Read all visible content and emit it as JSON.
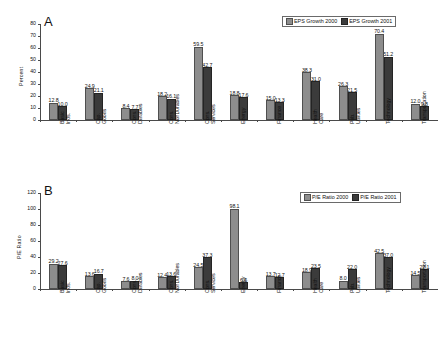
{
  "figure": {
    "panel_a_letter": "A",
    "panel_b_letter": "B"
  },
  "chart_data": [
    {
      "type": "bar",
      "panel": "A",
      "title": "A",
      "xlabel": "",
      "ylabel": "Percent",
      "ylim": [
        0,
        80
      ],
      "yticks": [
        0,
        10,
        20,
        30,
        40,
        50,
        60,
        70,
        80
      ],
      "grid": false,
      "legend_position": "top-right",
      "categories": [
        "Basic Inds.",
        "Cap. Goods",
        "Cons. Durables",
        "Cons. NonDurables",
        "Cons. Services",
        "Energy",
        "Finance",
        "Health Care",
        "Pub. Utilities",
        "Technology",
        "Transportation"
      ],
      "series": [
        {
          "name": "EPS Growth 2000",
          "color": "#8d8d8d",
          "values": [
            12.8,
            24.9,
            8.4,
            18.2,
            59.5,
            18.8,
            15.0,
            38.3,
            26.3,
            70.4,
            12.0
          ]
        },
        {
          "name": "EPS Growth 2001",
          "color": "#3b3b3b",
          "values": [
            10.0,
            21.1,
            7.7,
            16.1,
            42.7,
            17.6,
            13.3,
            31.0,
            21.5,
            51.2,
            9.8
          ]
        }
      ]
    },
    {
      "type": "bar",
      "panel": "B",
      "title": "B",
      "xlabel": "",
      "ylabel": "P/E Ratio",
      "ylim": [
        0,
        120
      ],
      "yticks": [
        0,
        20,
        40,
        60,
        80,
        100,
        120
      ],
      "grid": false,
      "legend_position": "top-right",
      "categories": [
        "Basic Inds.",
        "Cap. Goods",
        "Cons. Durables",
        "Cons. NonDurables",
        "Cons. Services",
        "Energy",
        "Finance",
        "Health Care",
        "Pub. Utilities",
        "Technology",
        "Transportation"
      ],
      "series": [
        {
          "name": "P/E Ratio 2000",
          "color": "#8d8d8d",
          "values": [
            29.2,
            13.6,
            7.6,
            12.4,
            24.5,
            98.1,
            13.7,
            18.9,
            8.0,
            42.5,
            14.5
          ]
        },
        {
          "name": "P/E Ratio 2001",
          "color": "#3b3b3b",
          "values": [
            27.6,
            16.7,
            8.0,
            13.6,
            37.3,
            6.6,
            12.7,
            23.5,
            22.0,
            37.0,
            22.1
          ]
        }
      ]
    }
  ]
}
